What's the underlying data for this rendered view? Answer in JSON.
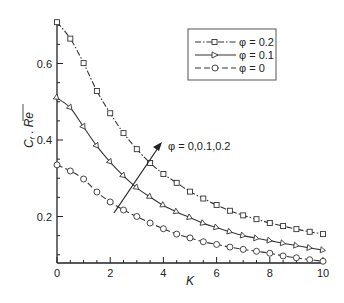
{
  "chart_data": {
    "type": "line",
    "title": "",
    "xlabel": "K",
    "ylabel": "C_f √Re",
    "ylabel_parts": {
      "main": "C",
      "sub": "f",
      "mid": " . ",
      "root": "Re"
    },
    "xlim": [
      0,
      10
    ],
    "ylim": [
      0.078,
      0.708
    ],
    "x_ticks": [
      0,
      2,
      4,
      6,
      8,
      10
    ],
    "x_tick_labels": [
      "0",
      "2",
      "4",
      "6",
      "8",
      "10"
    ],
    "y_ticks": [
      0.2,
      0.4,
      0.6
    ],
    "y_tick_labels": [
      "0.2",
      "0.4",
      "0.6"
    ],
    "grid": false,
    "legend_position": "upper right",
    "x": [
      0,
      0.5,
      1,
      1.5,
      2,
      2.5,
      3,
      3.5,
      4,
      4.5,
      5,
      5.5,
      6,
      6.5,
      7,
      7.5,
      8,
      8.5,
      9,
      9.5,
      10
    ],
    "series": [
      {
        "name": "φ = 0.2",
        "label": "φ = 0.2",
        "line_style": "dash-dot",
        "marker": "square",
        "values": [
          0.708,
          0.665,
          0.601,
          0.528,
          0.47,
          0.418,
          0.376,
          0.34,
          0.311,
          0.288,
          0.265,
          0.247,
          0.23,
          0.215,
          0.203,
          0.193,
          0.183,
          0.175,
          0.167,
          0.16,
          0.154
        ]
      },
      {
        "name": "φ = 0.1",
        "label": "φ = 0.1",
        "line_style": "solid",
        "marker": "triangle-right",
        "values": [
          0.51,
          0.484,
          0.434,
          0.384,
          0.342,
          0.306,
          0.275,
          0.251,
          0.229,
          0.212,
          0.197,
          0.182,
          0.171,
          0.16,
          0.15,
          0.143,
          0.137,
          0.13,
          0.124,
          0.118,
          0.112
        ]
      },
      {
        "name": "φ = 0",
        "label": "φ = 0",
        "line_style": "dashed",
        "marker": "circle",
        "values": [
          0.335,
          0.319,
          0.298,
          0.264,
          0.238,
          0.217,
          0.2,
          0.183,
          0.168,
          0.154,
          0.144,
          0.134,
          0.127,
          0.12,
          0.114,
          0.109,
          0.104,
          0.097,
          0.092,
          0.087,
          0.083
        ]
      }
    ],
    "annotations": [
      {
        "text": "φ = 0,0.1,0.2",
        "arrow_from": [
          2.1,
          0.21
        ],
        "arrow_to": [
          3.9,
          0.385
        ]
      }
    ]
  },
  "legend": {
    "items": [
      {
        "label": "φ = 0.2"
      },
      {
        "label": "φ = 0.1"
      },
      {
        "label": "φ = 0"
      }
    ]
  },
  "annotation": {
    "text": "φ = 0,0.1,0.2"
  },
  "axes": {
    "xlabel": "K",
    "ylabel_main": "C",
    "ylabel_sub": "f",
    "ylabel_root": "Re"
  }
}
